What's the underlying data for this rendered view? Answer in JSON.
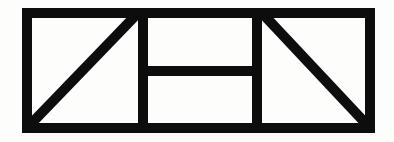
{
  "figure": {
    "background_color": "#fdfdfb",
    "ink_color": "#0d0d0d",
    "canvas": {
      "width": 394,
      "height": 142
    },
    "stroke_width": 10,
    "outer_rect": {
      "name": "outer-rectangle",
      "left": 22,
      "top": 8,
      "right": 375,
      "bottom": 133
    },
    "dividers": [
      {
        "name": "vertical-divider-left",
        "orientation": "vertical",
        "x": 143,
        "y1": 8,
        "y2": 133
      },
      {
        "name": "vertical-divider-right",
        "orientation": "vertical",
        "x": 257,
        "y1": 8,
        "y2": 133
      },
      {
        "name": "middle-cell-horizontal-divider",
        "orientation": "horizontal",
        "y": 71,
        "x1": 143,
        "x2": 257
      }
    ],
    "diagonals": [
      {
        "name": "left-cell-diagonal-rising",
        "direction": "bottom-left-to-top-right",
        "x1": 27,
        "y1": 128,
        "x2": 138,
        "y2": 13
      },
      {
        "name": "right-cell-diagonal-falling",
        "direction": "top-left-to-bottom-right",
        "x1": 262,
        "y1": 13,
        "x2": 370,
        "y2": 128
      }
    ],
    "cells": [
      {
        "name": "left-cell",
        "content": "rising diagonal"
      },
      {
        "name": "middle-cell",
        "content": "horizontal divider"
      },
      {
        "name": "right-cell",
        "content": "falling diagonal"
      }
    ]
  }
}
